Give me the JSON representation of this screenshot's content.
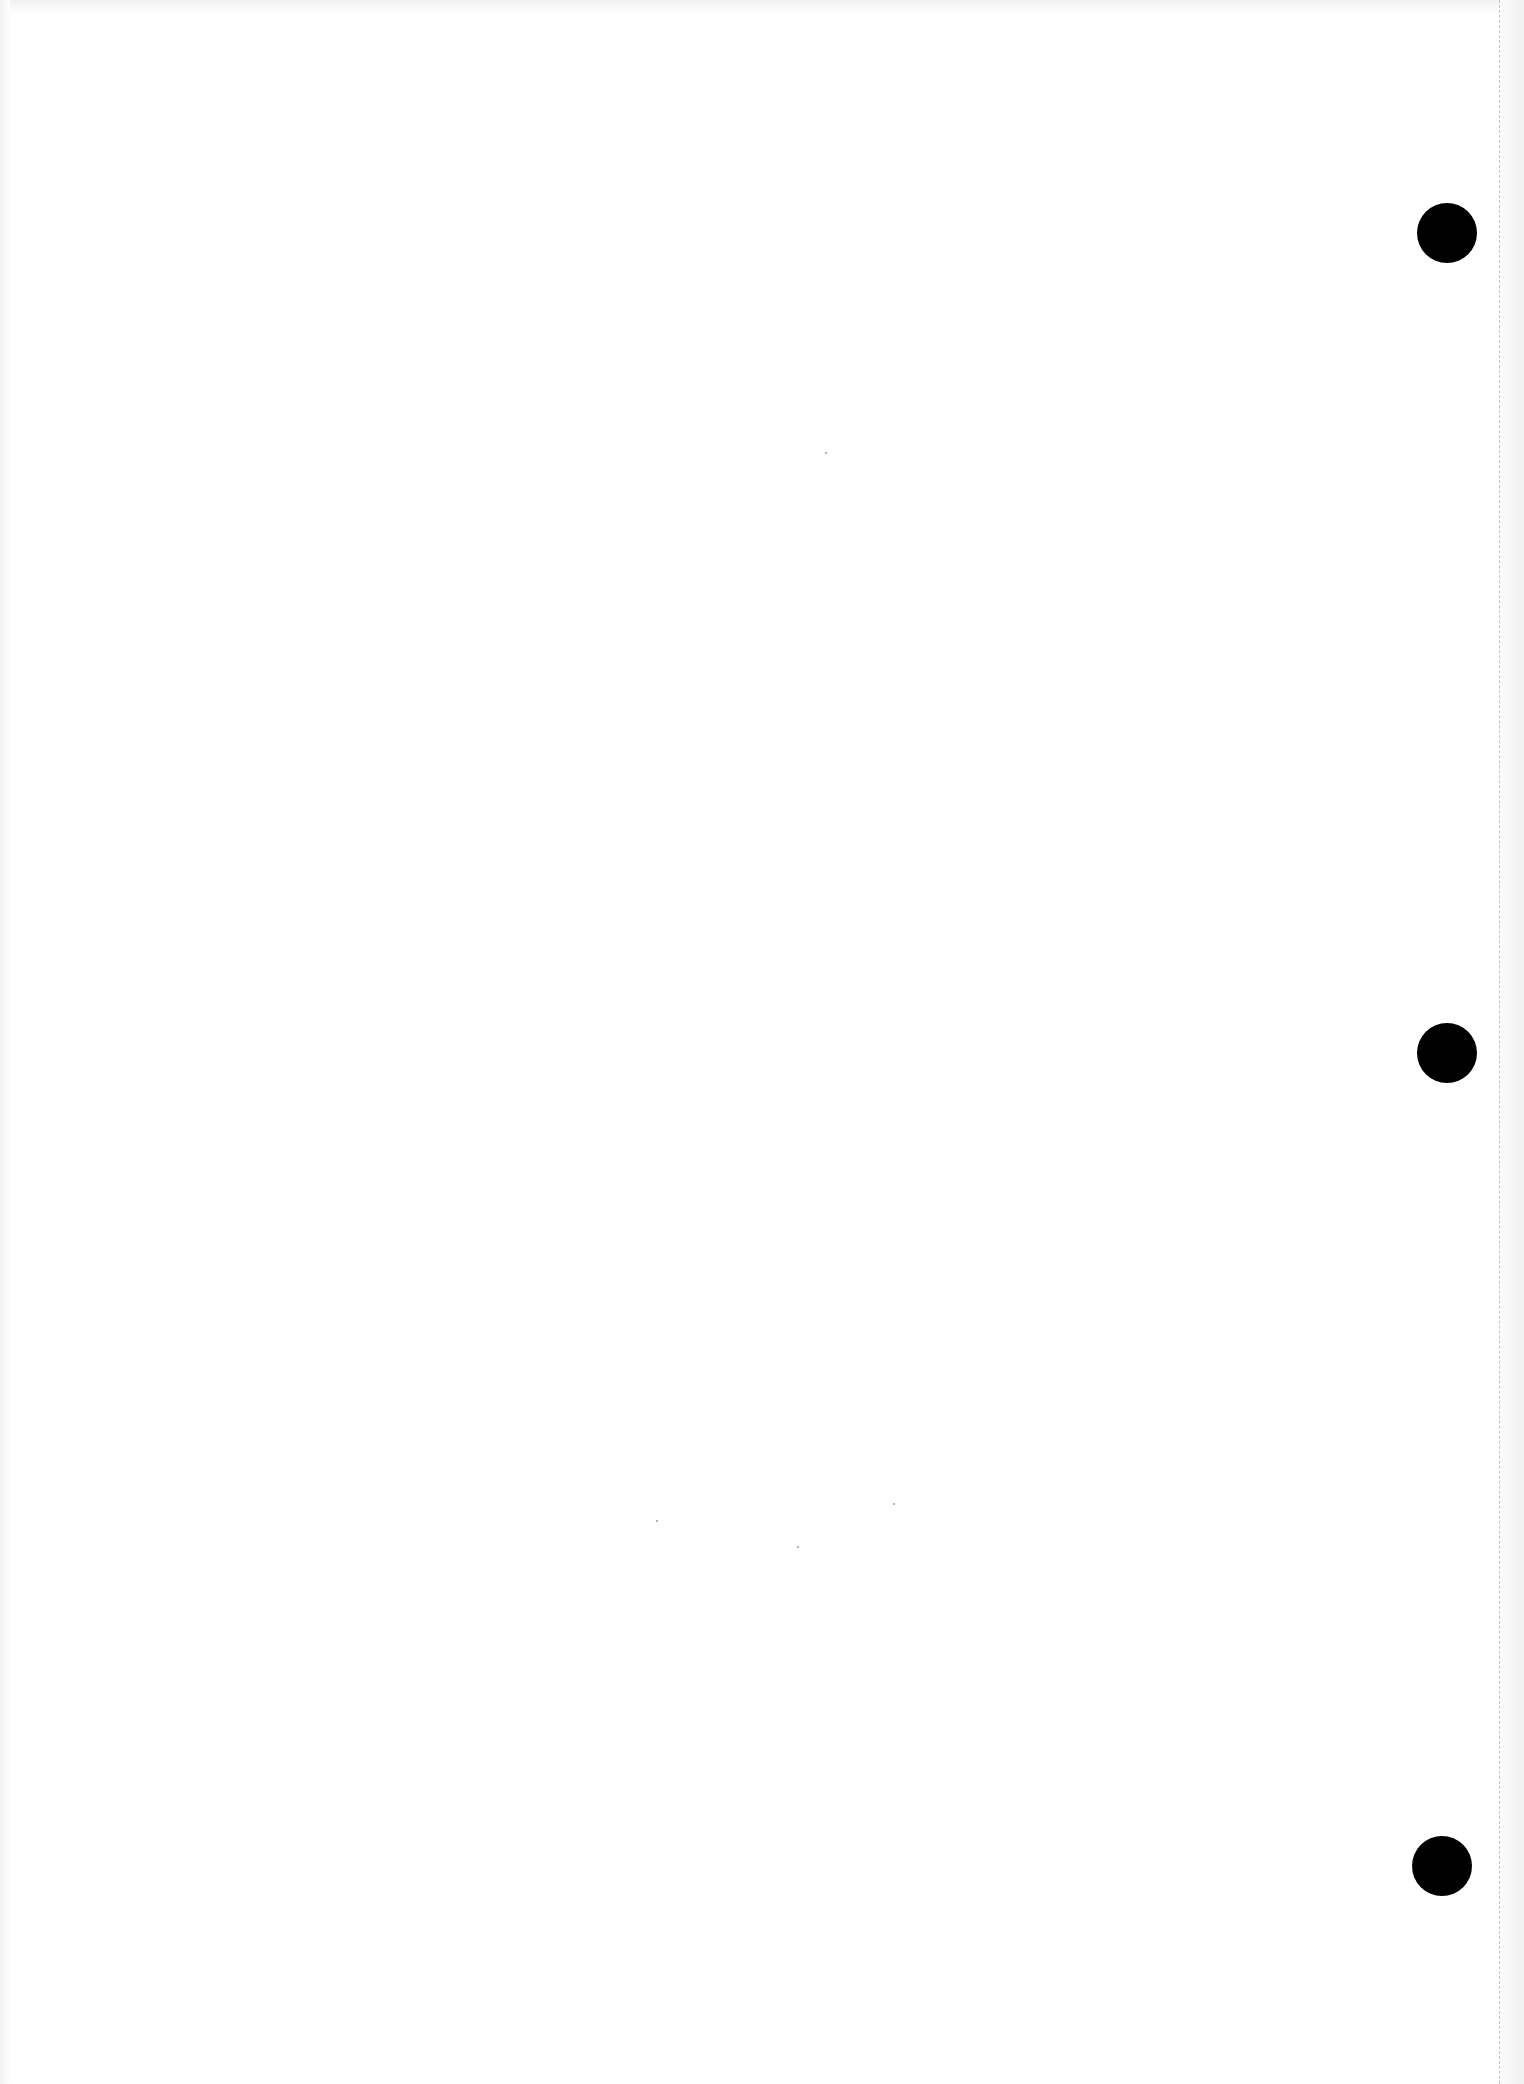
{
  "page": {
    "type": "blank-scanned-page",
    "background_color": "#ffffff",
    "text_content": ""
  },
  "punch_holes": [
    {
      "label": "top",
      "cx": 1447,
      "cy": 233,
      "diameter": 60,
      "color": "#000000"
    },
    {
      "label": "middle",
      "cx": 1447,
      "cy": 1053,
      "diameter": 60,
      "color": "#000000"
    },
    {
      "label": "bottom",
      "cx": 1442,
      "cy": 1866,
      "diameter": 60,
      "color": "#000000"
    }
  ],
  "perforation": {
    "x": 1499,
    "style": "dashed",
    "color": "#c4c4c4"
  }
}
